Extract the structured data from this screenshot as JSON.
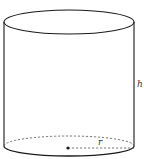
{
  "diagram": {
    "shape": "cylinder",
    "labels": {
      "height": "h",
      "radius": "r"
    },
    "colors": {
      "stroke": "#1a1a1a",
      "dashed": "#555555",
      "background": "#ffffff"
    }
  }
}
